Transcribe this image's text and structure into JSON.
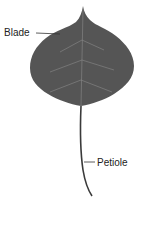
{
  "diagram": {
    "labels": {
      "blade": "Blade",
      "petiole": "Petiole"
    },
    "colors": {
      "blade_fill": "#555555",
      "veins": "#8a8a8a",
      "petiole": "#3a3a3a",
      "leader_line": "#333333"
    }
  }
}
